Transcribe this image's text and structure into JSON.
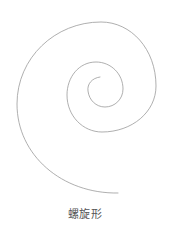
{
  "figure": {
    "shape": "spiral",
    "caption": "螺旋形",
    "stroke_color": "#9a9a9a",
    "background_color": "#ffffff"
  }
}
